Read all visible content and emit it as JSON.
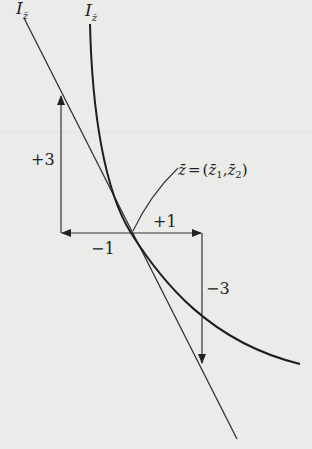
{
  "diagram": {
    "type": "indifference curve with tangent line",
    "colors": {
      "background": "#ebebea",
      "ink": "#222222"
    },
    "labels": {
      "tangent_line_label": {
        "main": "I",
        "sub": "z̄"
      },
      "curve_label": {
        "main": "I",
        "sub": "z̄"
      },
      "point_label": "z̄ = (z̄₁,z̄₂)",
      "point_label_parts": {
        "z": "z̄",
        "eq": "=",
        "open": "(",
        "z1": "z̄",
        "sub1": "1",
        "comma": ",",
        "z2": "z̄",
        "sub2": "2",
        "close": ")"
      },
      "up_arrow": "+3",
      "left_arrow": "−1",
      "right_arrow": "+1",
      "down_arrow": "−3"
    },
    "geometry": {
      "tangent_point": [
        131,
        233
      ],
      "tangent_line": {
        "from": [
          24,
          18
        ],
        "to": [
          237,
          439
        ]
      },
      "curve_path": "M90,24 C92,110 104,190 131,233 C162,282 210,342 300,364",
      "left_step": {
        "horizontal": [
          [
            131,
            233
          ],
          [
            61,
            233
          ]
        ],
        "vertical": [
          [
            61,
            233
          ],
          [
            61,
            96
          ]
        ]
      },
      "right_step": {
        "horizontal": [
          [
            131,
            233
          ],
          [
            202,
            233
          ]
        ],
        "vertical": [
          [
            202,
            233
          ],
          [
            202,
            363
          ]
        ]
      },
      "leader": "M133,231 Q150,195 178,168"
    }
  }
}
